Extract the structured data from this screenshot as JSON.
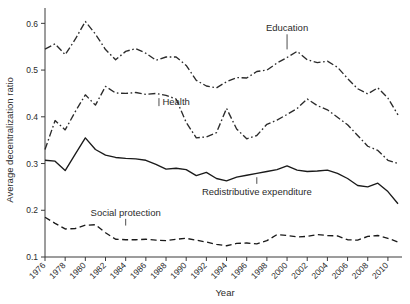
{
  "chart_data": {
    "type": "line",
    "title": "",
    "xlabel": "Year",
    "ylabel": "Average decentralization ratio",
    "xlim": [
      1976,
      2011
    ],
    "ylim": [
      0.1,
      0.62
    ],
    "yticks": [
      0.1,
      0.2,
      0.3,
      0.4,
      0.5,
      0.6
    ],
    "ytick_labels": [
      "0.1",
      "0.2",
      "0.3",
      "0.4",
      "0.5",
      "0.6"
    ],
    "xticks": [
      1976,
      1978,
      1980,
      1982,
      1984,
      1986,
      1988,
      1990,
      1992,
      1994,
      1996,
      1998,
      2000,
      2002,
      2004,
      2006,
      2008,
      2010
    ],
    "xtick_labels": [
      "1976",
      "1978",
      "1980",
      "1982",
      "1984",
      "1986",
      "1988",
      "1990",
      "1992",
      "1994",
      "1996",
      "1998",
      "2000",
      "2002",
      "2004",
      "2006",
      "2008",
      "2010"
    ],
    "grid": false,
    "legend_position": "inline-annotations",
    "x": [
      1976,
      1977,
      1978,
      1979,
      1980,
      1981,
      1982,
      1983,
      1984,
      1985,
      1986,
      1987,
      1988,
      1989,
      1990,
      1991,
      1992,
      1993,
      1994,
      1995,
      1996,
      1997,
      1998,
      1999,
      2000,
      2001,
      2002,
      2003,
      2004,
      2005,
      2006,
      2007,
      2008,
      2009,
      2010,
      2011
    ],
    "series": [
      {
        "name": "Education",
        "linestyle": "dash-dot",
        "color": "#2b2b2b",
        "values": [
          0.545,
          0.556,
          0.533,
          0.566,
          0.604,
          0.577,
          0.544,
          0.522,
          0.54,
          0.546,
          0.536,
          0.521,
          0.528,
          0.528,
          0.51,
          0.478,
          0.466,
          0.462,
          0.475,
          0.484,
          0.483,
          0.497,
          0.5,
          0.515,
          0.527,
          0.54,
          0.522,
          0.516,
          0.519,
          0.506,
          0.482,
          0.46,
          0.449,
          0.462,
          0.44,
          0.404
        ]
      },
      {
        "name": "Health",
        "linestyle": "dash-dot",
        "color": "#2b2b2b",
        "values": [
          0.33,
          0.392,
          0.372,
          0.411,
          0.447,
          0.425,
          0.465,
          0.451,
          0.45,
          0.452,
          0.448,
          0.45,
          0.446,
          0.438,
          0.388,
          0.355,
          0.357,
          0.366,
          0.418,
          0.374,
          0.353,
          0.36,
          0.384,
          0.393,
          0.405,
          0.418,
          0.438,
          0.424,
          0.415,
          0.399,
          0.383,
          0.36,
          0.337,
          0.328,
          0.307,
          0.3
        ]
      },
      {
        "name": "Redistributive expenditure",
        "linestyle": "solid",
        "color": "#1a1a1a",
        "values": [
          0.307,
          0.305,
          0.285,
          0.32,
          0.355,
          0.33,
          0.318,
          0.313,
          0.311,
          0.31,
          0.307,
          0.298,
          0.288,
          0.29,
          0.287,
          0.274,
          0.281,
          0.268,
          0.263,
          0.271,
          0.275,
          0.279,
          0.283,
          0.287,
          0.295,
          0.286,
          0.283,
          0.284,
          0.286,
          0.279,
          0.268,
          0.253,
          0.25,
          0.258,
          0.24,
          0.214
        ]
      },
      {
        "name": "Social protection",
        "linestyle": "dashed",
        "color": "#1a1a1a",
        "values": [
          0.185,
          0.172,
          0.16,
          0.161,
          0.168,
          0.169,
          0.152,
          0.138,
          0.137,
          0.137,
          0.138,
          0.136,
          0.135,
          0.138,
          0.14,
          0.136,
          0.132,
          0.127,
          0.124,
          0.129,
          0.13,
          0.128,
          0.135,
          0.148,
          0.146,
          0.143,
          0.144,
          0.148,
          0.146,
          0.145,
          0.137,
          0.136,
          0.144,
          0.146,
          0.14,
          0.132
        ]
      }
    ],
    "annotations": [
      {
        "text": "Education",
        "x": 2000,
        "y": 0.583,
        "leader_to_y": 0.54
      },
      {
        "text": "Health",
        "x": 1989,
        "y": 0.425,
        "leader_to_x": 1987.3
      },
      {
        "text": "Redistributive expenditure",
        "x": 1997,
        "y": 0.233,
        "leader_to_y": 0.275
      },
      {
        "text": "Social protection",
        "x": 1984,
        "y": 0.188,
        "leader_to_y": 0.163
      }
    ]
  }
}
